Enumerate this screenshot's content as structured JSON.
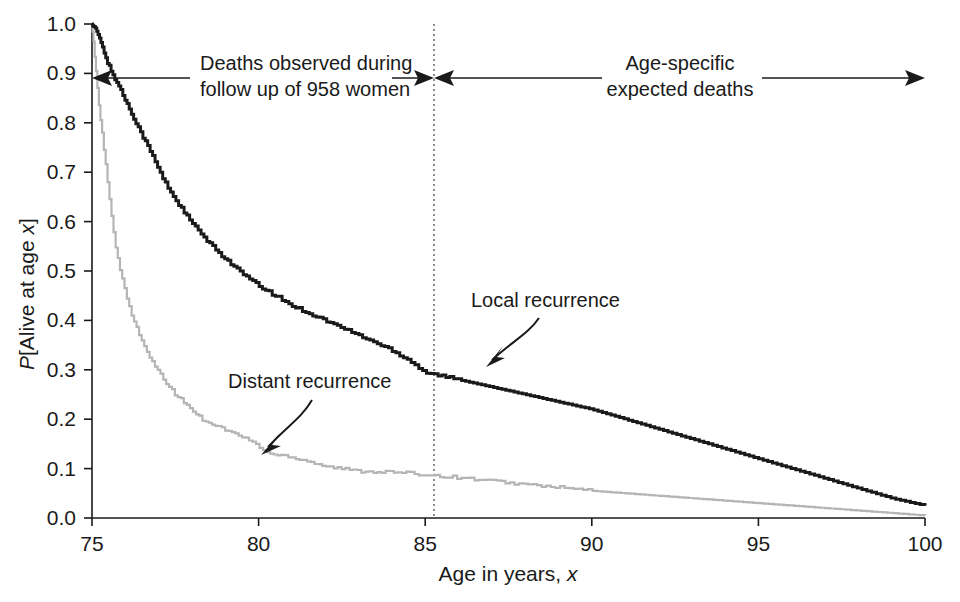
{
  "chart_data": {
    "type": "line",
    "title": "",
    "subtitle": "",
    "xlabel": "Age in years, x",
    "xlabel_plain": "Age in years,",
    "xlabel_italic": "x",
    "ylabel": "P[Alive at age x]",
    "ylabel_italic_1": "P",
    "ylabel_plain": "[Alive at age ",
    "ylabel_italic_2": "x",
    "ylabel_close": "]",
    "xlim": [
      75,
      100
    ],
    "ylim": [
      0.0,
      1.0
    ],
    "xticks": [
      75,
      80,
      85,
      90,
      95,
      100
    ],
    "xticklabels": [
      "75",
      "80",
      "85",
      "90",
      "95",
      "100"
    ],
    "yticks": [
      0.0,
      0.1,
      0.2,
      0.3,
      0.4,
      0.5,
      0.6,
      0.7,
      0.8,
      0.9,
      1.0
    ],
    "yticklabels": [
      "0.0",
      "0.1",
      "0.2",
      "0.3",
      "0.4",
      "0.5",
      "0.6",
      "0.7",
      "0.8",
      "0.9",
      "1.0"
    ],
    "grid": false,
    "legend_position": "inline-annotations",
    "series": [
      {
        "name": "Local recurrence",
        "color": "#1a1a1a",
        "style": "step",
        "x": [
          75.0,
          75.15,
          75.3,
          75.45,
          75.6,
          75.8,
          76.0,
          76.25,
          76.5,
          76.8,
          77.1,
          77.4,
          77.8,
          78.2,
          78.6,
          79.0,
          79.5,
          80.0,
          80.5,
          81.0,
          81.5,
          82.0,
          82.5,
          83.0,
          83.5,
          84.0,
          84.5,
          85.0,
          86.0,
          87.0,
          88.0,
          89.0,
          90.0,
          91.0,
          92.0,
          93.0,
          94.0,
          95.0,
          96.0,
          97.0,
          98.0,
          99.0,
          100.0
        ],
        "y": [
          1.0,
          0.985,
          0.955,
          0.925,
          0.9,
          0.875,
          0.845,
          0.81,
          0.775,
          0.735,
          0.69,
          0.655,
          0.615,
          0.58,
          0.55,
          0.525,
          0.495,
          0.47,
          0.45,
          0.43,
          0.415,
          0.4,
          0.385,
          0.37,
          0.355,
          0.34,
          0.32,
          0.295,
          0.28,
          0.265,
          0.25,
          0.235,
          0.22,
          0.2,
          0.18,
          0.16,
          0.14,
          0.12,
          0.1,
          0.08,
          0.06,
          0.04,
          0.025
        ]
      },
      {
        "name": "Distant recurrence",
        "color": "#b5b5b5",
        "style": "step",
        "x": [
          75.0,
          75.1,
          75.2,
          75.3,
          75.4,
          75.5,
          75.6,
          75.7,
          75.85,
          76.0,
          76.2,
          76.4,
          76.6,
          76.9,
          77.2,
          77.5,
          77.9,
          78.3,
          78.8,
          79.3,
          79.8,
          80.3,
          80.9,
          81.5,
          82.0,
          82.5,
          83.0,
          84.0,
          85.0,
          86.0,
          87.0,
          88.0,
          89.0,
          90.0,
          92.0,
          94.0,
          96.0,
          98.0,
          100.0
        ],
        "y": [
          1.0,
          0.92,
          0.84,
          0.78,
          0.72,
          0.66,
          0.6,
          0.55,
          0.5,
          0.455,
          0.41,
          0.375,
          0.34,
          0.305,
          0.275,
          0.25,
          0.225,
          0.2,
          0.185,
          0.17,
          0.155,
          0.13,
          0.125,
          0.115,
          0.105,
          0.1,
          0.095,
          0.093,
          0.088,
          0.082,
          0.075,
          0.068,
          0.062,
          0.055,
          0.045,
          0.035,
          0.025,
          0.015,
          0.005
        ]
      }
    ],
    "annotations": [
      {
        "id": "observed-span",
        "text_line1": "Deaths observed during",
        "text_line2": "follow up of 958 women",
        "span_start_age": 75,
        "span_end_age": 85
      },
      {
        "id": "expected-span",
        "text_line1": "Age-specific",
        "text_line2": "expected deaths",
        "span_start_age": 85,
        "span_end_age": 100
      },
      {
        "id": "local-pointer",
        "text": "Local recurrence",
        "points_to_series": "Local recurrence"
      },
      {
        "id": "distant-pointer",
        "text": "Distant recurrence",
        "points_to_series": "Distant recurrence"
      }
    ],
    "marker_lines": [
      {
        "id": "age-85-divider",
        "x": 85,
        "style": "dotted",
        "color": "#4d4d4d"
      }
    ]
  },
  "colors": {
    "local_curve": "#1a1a1a",
    "distant_curve": "#b5b5b5",
    "axis": "#1a1a1a",
    "divider": "#4d4d4d",
    "background": "#ffffff"
  }
}
